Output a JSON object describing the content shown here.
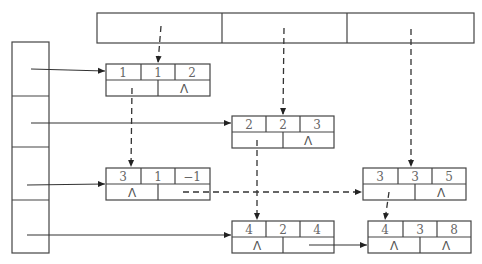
{
  "diagram": {
    "title": "",
    "column_heads": {
      "count": 3
    },
    "row_heads": {
      "count": 4
    },
    "null_symbol": "Λ",
    "nodes": [
      {
        "id": "n1",
        "row": "1",
        "col": "1",
        "value": "2",
        "down": "",
        "right": "Λ"
      },
      {
        "id": "n2",
        "row": "2",
        "col": "2",
        "value": "3",
        "down": "",
        "right": "Λ"
      },
      {
        "id": "n3",
        "row": "3",
        "col": "1",
        "value": "−1",
        "down": "Λ",
        "right": ""
      },
      {
        "id": "n4",
        "row": "3",
        "col": "3",
        "value": "5",
        "down": "",
        "right": "Λ"
      },
      {
        "id": "n5",
        "row": "4",
        "col": "2",
        "value": "4",
        "down": "Λ",
        "right": ""
      },
      {
        "id": "n6",
        "row": "4",
        "col": "3",
        "value": "8",
        "down": "Λ",
        "right": "Λ"
      }
    ],
    "edges": [
      {
        "from": "row-head-1",
        "to": "n1",
        "style": "solid"
      },
      {
        "from": "row-head-2",
        "to": "n2",
        "style": "solid"
      },
      {
        "from": "row-head-3",
        "to": "n3",
        "style": "solid"
      },
      {
        "from": "row-head-4",
        "to": "n5",
        "style": "solid"
      },
      {
        "from": "n5",
        "to": "n6",
        "style": "solid"
      },
      {
        "from": "n3",
        "to": "n4",
        "style": "dashed"
      },
      {
        "from": "col-head-1",
        "to": "n1",
        "style": "dashed"
      },
      {
        "from": "col-head-2",
        "to": "n2",
        "style": "dashed"
      },
      {
        "from": "col-head-3",
        "to": "n4",
        "style": "dashed"
      },
      {
        "from": "n1",
        "to": "n3",
        "style": "dashed"
      },
      {
        "from": "n2",
        "to": "n5",
        "style": "dashed"
      },
      {
        "from": "n4",
        "to": "n6",
        "style": "dashed"
      }
    ]
  }
}
